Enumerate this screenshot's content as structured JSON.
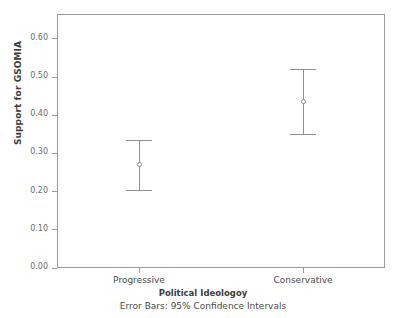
{
  "chart_data": {
    "type": "scatter",
    "title": "",
    "xlabel": "Political Ideologoy",
    "ylabel": "Support for GSOMIA",
    "footnote": "Error Bars: 95% Confidence Intervals",
    "categories": [
      "Progressive",
      "Conservative"
    ],
    "values": [
      0.27,
      0.435
    ],
    "ci_lower": [
      0.205,
      0.35
    ],
    "ci_upper": [
      0.335,
      0.52
    ],
    "ylim": [
      0.0,
      0.665
    ],
    "y_ticks": [
      0.0,
      0.1,
      0.2,
      0.3,
      0.4,
      0.5,
      0.6
    ],
    "y_tick_labels": [
      "0.00",
      "0.10",
      "0.20",
      "0.30",
      "0.40",
      "0.50",
      "0.60"
    ],
    "grid": false,
    "legend": "none",
    "error_bar_type": "95% Confidence Intervals",
    "series": [
      {
        "name": "Support for GSOMIA",
        "points": [
          {
            "category": "Progressive",
            "mean": 0.27,
            "ci_lower": 0.205,
            "ci_upper": 0.335
          },
          {
            "category": "Conservative",
            "mean": 0.435,
            "ci_lower": 0.35,
            "ci_upper": 0.52
          }
        ]
      }
    ],
    "colors": {
      "marker": "#8a8a8a",
      "whisker": "#8f8f8f",
      "frame": "#9a9a9a",
      "tick_text": "#6b6b6b",
      "axis_title": "#3c3c3c",
      "background": "#ffffff"
    }
  }
}
